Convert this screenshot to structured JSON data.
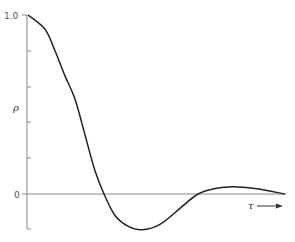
{
  "chart_data": {
    "type": "line",
    "title": "",
    "xlabel": "τ",
    "ylabel": "ρ",
    "ylim": [
      -0.2,
      1.0
    ],
    "y_tick_labels": [
      "1.0",
      "0"
    ],
    "y_ticks": [
      1.0,
      0.8,
      0.6,
      0.4,
      0.2,
      0.0,
      -0.2
    ],
    "grid": false,
    "legend": null,
    "annotations": [
      "τ →"
    ],
    "series": [
      {
        "name": "ρ(τ)",
        "x": [
          0,
          17,
          27,
          37,
          47,
          57,
          67,
          76,
          87,
          100,
          114,
          132,
          152,
          170,
          187,
          205,
          227,
          257
        ],
        "values": [
          1.0,
          0.92,
          0.8,
          0.66,
          0.53,
          0.33,
          0.13,
          0.0,
          -0.12,
          -0.18,
          -0.2,
          -0.17,
          -0.08,
          0.0,
          0.03,
          0.04,
          0.03,
          0.0
        ]
      }
    ]
  },
  "labels": {
    "y_top": "1.0",
    "y_zero": "0",
    "y_axis": "ρ",
    "x_axis": "τ"
  },
  "colors": {
    "curve": "#222222",
    "axis": "#888888",
    "text": "#333333"
  }
}
